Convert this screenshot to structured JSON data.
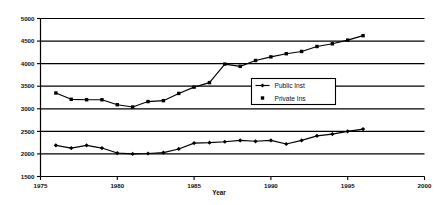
{
  "chart_data": {
    "type": "line",
    "title": "",
    "xlabel": "Year",
    "ylabel": "",
    "xlim": [
      1975,
      2000
    ],
    "ylim": [
      1500,
      5000
    ],
    "xticks": [
      1975,
      1980,
      1985,
      1990,
      1995,
      2000
    ],
    "yticks": [
      1500,
      2000,
      2500,
      3000,
      3500,
      4000,
      4500,
      5000
    ],
    "xtick_labels": [
      "1975",
      "1980",
      "1985",
      "1990",
      "1995",
      "2000"
    ],
    "ytick_labels": [
      "1500",
      "2000",
      "2500",
      "3000",
      "3500",
      "4000",
      "4500",
      "5000"
    ],
    "grid": true,
    "grid_axis": "y",
    "legend_position": "center-right",
    "x": [
      1976,
      1977,
      1978,
      1979,
      1980,
      1981,
      1982,
      1983,
      1984,
      1985,
      1986,
      1987,
      1988,
      1989,
      1990,
      1991,
      1992,
      1993,
      1994,
      1995,
      1996
    ],
    "series": [
      {
        "name": "Public Inst",
        "marker": "diamond",
        "values": [
          2190,
          2130,
          2190,
          2130,
          2020,
          2000,
          2010,
          2030,
          2110,
          2240,
          2250,
          2270,
          2300,
          2280,
          2300,
          2220,
          2300,
          2400,
          2440,
          2500,
          2550
        ]
      },
      {
        "name": "Private Ins",
        "marker": "square",
        "values": [
          3350,
          3210,
          3200,
          3200,
          3090,
          3040,
          3160,
          3180,
          3340,
          3480,
          3580,
          3990,
          3940,
          4070,
          4150,
          4220,
          4270,
          4380,
          4440,
          4520,
          4620
        ]
      }
    ]
  },
  "legend": {
    "entries": [
      {
        "label": "Public Inst",
        "marker": "diamond"
      },
      {
        "label": "Private Ins",
        "marker": "square"
      }
    ]
  },
  "axes": {
    "x_title": "Year"
  }
}
